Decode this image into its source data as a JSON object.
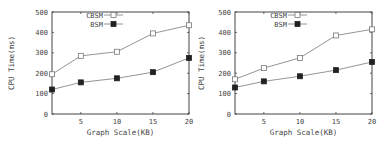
{
  "chart_data": [
    {
      "type": "line",
      "title": "",
      "xlabel": "Graph Scale(KB)",
      "ylabel": "CPU Time(ms)",
      "x": [
        1,
        5,
        10,
        15,
        20
      ],
      "x_ticks": [
        5,
        10,
        15,
        20
      ],
      "y_ticks": [
        0,
        100,
        200,
        300,
        400,
        500
      ],
      "xlim": [
        0,
        20
      ],
      "ylim": [
        0,
        500
      ],
      "grid": false,
      "legend_position": "top-left",
      "series": [
        {
          "name": "CBSM",
          "marker": "open-square",
          "values": [
            195,
            285,
            305,
            395,
            435
          ]
        },
        {
          "name": "BSM",
          "marker": "filled-square",
          "values": [
            120,
            155,
            175,
            205,
            275
          ]
        }
      ]
    },
    {
      "type": "line",
      "title": "",
      "xlabel": "Graph Scale(KB)",
      "ylabel": "CPU Time(ms)",
      "x": [
        1,
        5,
        10,
        15,
        20
      ],
      "x_ticks": [
        5,
        10,
        15,
        20
      ],
      "y_ticks": [
        0,
        100,
        200,
        300,
        400,
        500
      ],
      "xlim": [
        0,
        20
      ],
      "ylim": [
        0,
        500
      ],
      "grid": false,
      "legend_position": "top-left",
      "series": [
        {
          "name": "CBSM",
          "marker": "open-square",
          "values": [
            170,
            225,
            275,
            385,
            415
          ]
        },
        {
          "name": "BSM",
          "marker": "filled-square",
          "values": [
            130,
            160,
            185,
            215,
            255
          ]
        }
      ]
    }
  ],
  "colors": {
    "line": "#888888",
    "axis": "#444444",
    "marker_fill": "#222222"
  }
}
